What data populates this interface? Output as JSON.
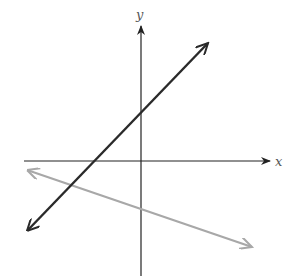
{
  "diagram": {
    "type": "coordinate-plane",
    "axes": {
      "x_label": "x",
      "y_label": "y",
      "color": "#222222"
    },
    "lines": [
      {
        "name": "dark-line",
        "color": "#2a2a2a",
        "slope_sign": "positive",
        "y_intercept_sign": "positive",
        "x_intercept_sign": "negative"
      },
      {
        "name": "gray-line",
        "color": "#a8a8a8",
        "slope_sign": "negative",
        "y_intercept_sign": "negative"
      }
    ]
  }
}
